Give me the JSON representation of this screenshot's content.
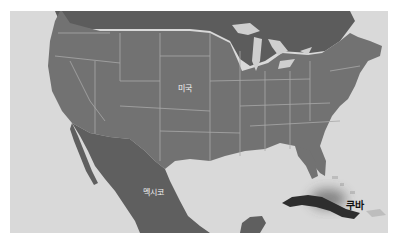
{
  "map": {
    "style": "grayscale highlight map",
    "colors": {
      "ocean": "#d9d9d9",
      "land": "#727272",
      "canada": "#5c5c5c",
      "borders": "#a8a8a8",
      "lakes": "#cfcfcf",
      "highlight_country": "#2e2e2e",
      "page_background": "#ffffff"
    },
    "labels": {
      "usa": "미국",
      "mexico": "멕시코",
      "cuba": "쿠바"
    },
    "highlighted_country": "쿠바"
  }
}
